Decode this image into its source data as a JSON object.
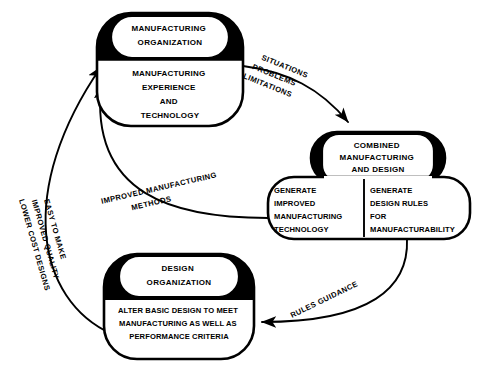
{
  "diagram": {
    "stroke_color": "#000000",
    "fill_color": "#ffffff",
    "header_fill": "#000000",
    "background": "#ffffff"
  },
  "nodes": [
    {
      "id": "manufacturing-organization",
      "title_lines": [
        "MANUFACTURING",
        "ORGANIZATION"
      ],
      "body_lines": [
        "MANUFACTURING",
        "EXPERIENCE",
        "AND",
        "TECHNOLOGY"
      ]
    },
    {
      "id": "combined-manufacturing-and-design",
      "title_lines": [
        "COMBINED",
        "MANUFACTURING",
        "AND DESIGN"
      ],
      "body_left_lines": [
        "GENERATE",
        "IMPROVED",
        "MANUFACTURING",
        "TECHNOLOGY"
      ],
      "body_right_lines": [
        "GENERATE",
        "DESIGN RULES",
        "FOR",
        "MANUFACTURABILITY"
      ]
    },
    {
      "id": "design-organization",
      "title_lines": [
        "DESIGN",
        "ORGANIZATION"
      ],
      "body_lines": [
        "ALTER BASIC DESIGN TO MEET",
        "MANUFACTURING AS WELL AS",
        "PERFORMANCE CRITERIA"
      ]
    }
  ],
  "edges": [
    {
      "id": "situations-problems-limitations",
      "from": "manufacturing-organization",
      "to": "combined-manufacturing-and-design",
      "label_lines": [
        "SITUATIONS",
        "PROBLEMS",
        "LIMITATIONS"
      ]
    },
    {
      "id": "improved-manufacturing-methods",
      "from": "combined-manufacturing-and-design",
      "to": "manufacturing-organization",
      "label_lines": [
        "IMPROVED MANUFACTURING",
        "METHODS"
      ]
    },
    {
      "id": "rules-guidance",
      "from": "combined-manufacturing-and-design",
      "to": "design-organization",
      "label_lines": [
        "RULES GUIDANCE"
      ]
    },
    {
      "id": "easy-to-make-improved-quality-lower-cost-designs",
      "from": "design-organization",
      "to": "manufacturing-organization",
      "label_lines": [
        "EASY TO MAKE",
        "IMPROVED QUALITY",
        "LOWER COST DESIGNS"
      ]
    }
  ]
}
